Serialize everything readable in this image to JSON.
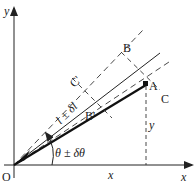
{
  "diagram": {
    "type": "polar-coordinate-uncertainty",
    "axes": {
      "x_label": "x",
      "y_label": "y",
      "origin_label": "O"
    },
    "points": {
      "A": "A",
      "B": "B",
      "C": "C",
      "C_prime": "C'",
      "B_prime": "B'"
    },
    "annotations": {
      "length": "l ± δl",
      "angle": "θ ± δθ",
      "x_projection": "x",
      "y_projection": "y"
    },
    "colors": {
      "line": "#222222",
      "background": "#ffffff"
    }
  }
}
